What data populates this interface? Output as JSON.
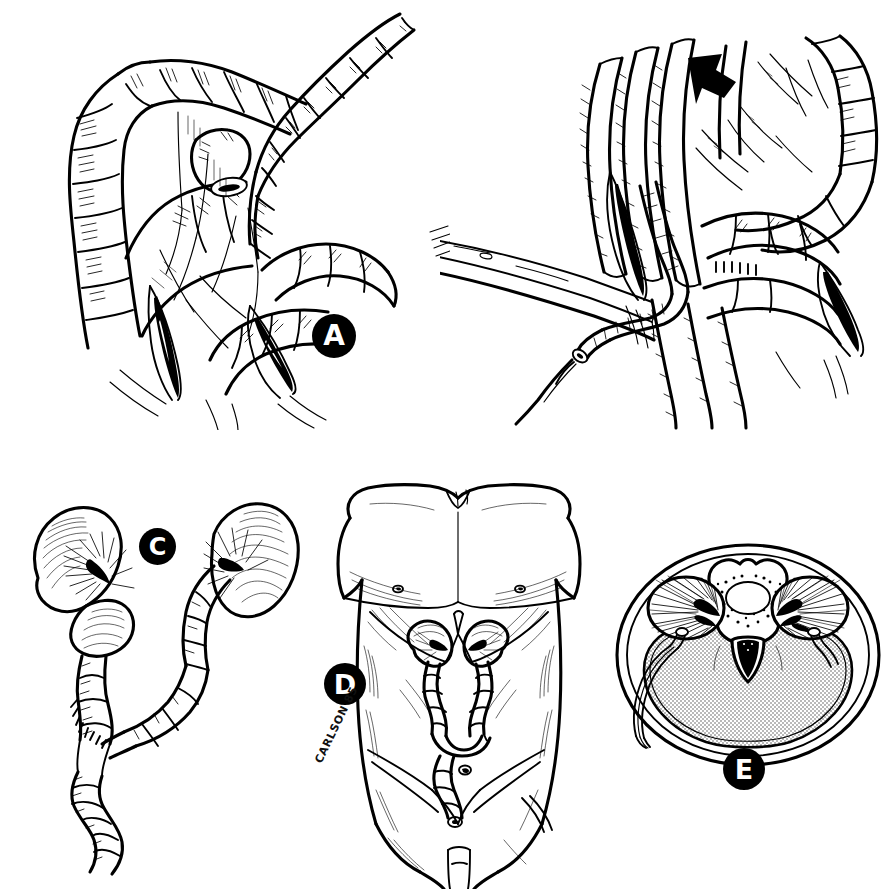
{
  "figure": {
    "type": "medical-illustration",
    "style": "pen-and-ink line drawing",
    "background_color": "#ffffff",
    "ink_color": "#000000",
    "shade_color": "#d8d8d8",
    "signature": "CARLSON 85",
    "panel_count": 5
  },
  "panels": [
    {
      "id": "A",
      "label": "A",
      "position": "top-left",
      "title": "Bowel loops with mesenteric vessels and incised mesenteric windows",
      "features": [
        "haustrated large bowel loops",
        "transected bowel stump with open lumen",
        "mesentery with vascular arcades",
        "two dark wedge-shaped mesenteric incisions",
        "cut vessel stumps"
      ]
    },
    {
      "id": "B",
      "label": "B",
      "position": "top-right",
      "title": "Ureter mobilized beneath bowel with retractor and suture needle",
      "features": [
        "malleable retractor blade with fenestrations",
        "curved surgical needle with suture strand",
        "mobilized ureter passing under mesentery",
        "solid black arrow indicating retroperitoneal tunnel",
        "dark wedge-shaped mesenteric windows",
        "bowel loops with serosal hatching"
      ],
      "annotations": [
        {
          "name": "direction-arrow",
          "shape": "solid black arrowhead",
          "points": "down-left"
        }
      ]
    },
    {
      "id": "C",
      "label": "C",
      "position": "bottom-left",
      "title": "Completed transureteroureterostomy — both kidneys with ureters joined end-to-side",
      "features": [
        "left kidney with hilum",
        "right kidney with hilum",
        "donor ureter crossing midline",
        "end-to-side anastomosis with interrupted sutures",
        "distal ureter continuing toward bladder"
      ]
    },
    {
      "id": "D",
      "label": "D",
      "position": "bottom-center",
      "title": "Anterior torso showing in-situ position of kidneys, crossed ureter and bladder",
      "features": [
        "male torso, chest and abdomen",
        "costal margins and rib shading",
        "both kidneys in renal fossae",
        "crossing ureter anastomosis",
        "bladder in pelvis",
        "iliac crests and inguinal regions",
        "umbilicus"
      ]
    },
    {
      "id": "E",
      "label": "E",
      "position": "bottom-right",
      "title": "Axial cross-section at the level of the kidneys showing retroperitoneal ureteric course",
      "features": [
        "body wall outline, oval",
        "vertebral body with spinal canal and cord",
        "transverse processes",
        "paired kidneys with radiating medullary pyramids",
        "aorta (solid black)",
        "shaded peritoneal cavity",
        "ureter coursing retroperitoneally around the flank"
      ]
    }
  ]
}
